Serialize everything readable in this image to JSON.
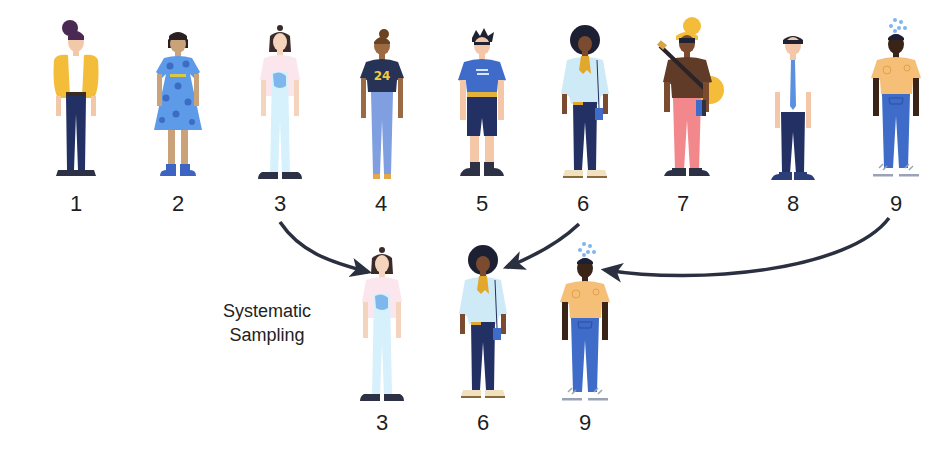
{
  "title": "Systematic Sampling",
  "caption": {
    "line1": "Systematic",
    "line2": "Sampling"
  },
  "population": {
    "labels": [
      "1",
      "2",
      "3",
      "4",
      "5",
      "6",
      "7",
      "8",
      "9"
    ],
    "sampling_interval": 3,
    "people": [
      {
        "id": "1",
        "desc": "woman with purple bun hair, yellow cardigan, white top, navy jeans, dark sneakers",
        "colors": {
          "hair": "#4a2a52",
          "skin": "#f1c9a8",
          "top": "#f3bd3a",
          "inner": "#ffffff",
          "bottom": "#223063",
          "shoes": "#2c3146"
        }
      },
      {
        "id": "2",
        "desc": "woman with short dark bob, blue polka-dot dress, blue boots",
        "colors": {
          "hair": "#2a1f22",
          "skin": "#c9a27a",
          "top": "#5d9be8",
          "dots": "#3d6cc5",
          "bottom": "#5d9be8",
          "shoes": "#3d63c3"
        }
      },
      {
        "id": "3",
        "desc": "woman with top-knot hair, light pink top, pale blue overalls, dark sneakers",
        "colors": {
          "hair": "#3b2a2a",
          "skin": "#f5d4bd",
          "top": "#fbe6ee",
          "inner": "#7fb6ec",
          "bottom": "#d6f1fb",
          "shoes": "#2c3146"
        }
      },
      {
        "id": "4",
        "desc": "woman with bun hair, navy tee with 24, light blue jeans, tan sandals",
        "colors": {
          "hair": "#6b4320",
          "skin": "#9b6a42",
          "top": "#273257",
          "accent": "#f3c93d",
          "bottom": "#7f9fe0",
          "shoes": "#e2a84a"
        }
      },
      {
        "id": "5",
        "desc": "man with dark spiky hair, blue tee, navy shorts, dark sneakers",
        "colors": {
          "hair": "#1f2230",
          "skin": "#f3c7a8",
          "top": "#3f6cc8",
          "belt": "#e2b23a",
          "bottom": "#223063",
          "shoes": "#2c3146"
        }
      },
      {
        "id": "6",
        "desc": "woman with curly afro, light blue jacket, mustard scarf, navy jeans, cross-body bag",
        "colors": {
          "hair": "#1d1f33",
          "skin": "#7a4b2e",
          "top": "#cfeaf7",
          "accent": "#e2a82c",
          "bottom": "#223063",
          "shoes": "#f2e1bf"
        }
      },
      {
        "id": "7",
        "desc": "person with yellow cap and guitar, brown tee, pink pants, holding books",
        "colors": {
          "hair": "#2a2428",
          "skin": "#7a4b2e",
          "top": "#5f3b28",
          "accent": "#f3bd3a",
          "bottom": "#f2888c",
          "shoes": "#2c3146"
        }
      },
      {
        "id": "8",
        "desc": "man with short hair, white shirt with blue tie, navy trousers, dark shoes",
        "colors": {
          "hair": "#1f2230",
          "skin": "#f3c7a8",
          "top": "#ffffff",
          "accent": "#5b8fe0",
          "bottom": "#223063",
          "shoes": "#2c3e78"
        }
      },
      {
        "id": "9",
        "desc": "man with dark skin, orange tee, blue jeans, grey sneakers, bubbles above head",
        "colors": {
          "hair": "#1d1f33",
          "skin": "#3a2418",
          "top": "#f5bf78",
          "accent": "#7fb6ec",
          "bottom": "#3f6cc8",
          "shoes": "#9aa3b6"
        }
      }
    ]
  },
  "sample": {
    "labels": [
      "3",
      "6",
      "9"
    ]
  },
  "arrows": [
    {
      "from": "3",
      "to": "sample-3"
    },
    {
      "from": "6",
      "to": "sample-6"
    },
    {
      "from": "9",
      "to": "sample-9"
    }
  ],
  "colors": {
    "arrow": "#2b3040",
    "text": "#1f1f1f",
    "background": "#ffffff"
  }
}
